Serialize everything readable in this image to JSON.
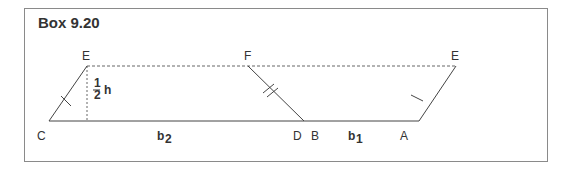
{
  "title": "Box 9.20",
  "labels": {
    "E_left": "E",
    "F": "F",
    "E_right": "E",
    "C": "C",
    "D": "D",
    "B": "B",
    "A": "A",
    "b2": "b",
    "b2_sub": "2",
    "b1": "b",
    "b1_sub": "1",
    "half_num": "1",
    "half_den": "2",
    "h": "h"
  },
  "colors": {
    "line": "#444444",
    "border": "#8a8a8a",
    "text": "#333333"
  }
}
